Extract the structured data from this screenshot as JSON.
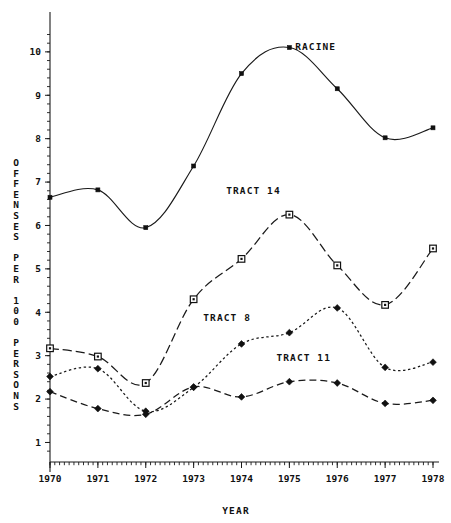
{
  "chart_data": {
    "type": "line",
    "title": "",
    "xlabel": "YEAR",
    "ylabel": "OFFENSES PER 100 PERSONS",
    "x": [
      1970,
      1971,
      1972,
      1973,
      1974,
      1975,
      1976,
      1977,
      1978
    ],
    "xticklabels": [
      "1970",
      "1971",
      "1972",
      "1973",
      "1974",
      "1975",
      "1976",
      "1977",
      "1978"
    ],
    "yticklabels": [
      "1",
      "2",
      "3",
      "4",
      "5",
      "6",
      "7",
      "8",
      "9",
      "10"
    ],
    "yticks": [
      1,
      2,
      3,
      4,
      5,
      6,
      7,
      8,
      9,
      10
    ],
    "xlim": [
      1970,
      1978
    ],
    "ylim": [
      0.55,
      10.55
    ],
    "grid": false,
    "legend_position": "inline-annotations",
    "minor_ticks": true,
    "series": [
      {
        "name": "RACINE",
        "marker": "filled-square",
        "linestyle": "solid",
        "label_x": 1975.55,
        "label_y": 10.05,
        "values": [
          6.65,
          6.82,
          5.95,
          7.37,
          9.5,
          10.1,
          9.15,
          8.02,
          8.25
        ]
      },
      {
        "name": "TRACT 14",
        "marker": "open-square",
        "linestyle": "dash-dot",
        "label_x": 1974.25,
        "label_y": 6.72,
        "values": [
          3.17,
          2.98,
          2.37,
          4.3,
          5.23,
          6.25,
          5.08,
          4.17,
          5.47
        ]
      },
      {
        "name": "TRACT 8",
        "marker": "filled-diamond",
        "linestyle": "dotted",
        "label_x": 1973.7,
        "label_y": 3.8,
        "values": [
          2.52,
          2.7,
          1.72,
          2.27,
          3.27,
          3.53,
          4.1,
          2.73,
          2.85
        ]
      },
      {
        "name": "TRACT 11",
        "marker": "filled-diamond",
        "linestyle": "dashed",
        "label_x": 1975.3,
        "label_y": 2.88,
        "values": [
          2.17,
          1.78,
          1.65,
          2.28,
          2.05,
          2.4,
          2.37,
          1.9,
          1.97
        ]
      }
    ]
  },
  "axis": {
    "y_title_chars": [
      "O",
      "F",
      "F",
      "E",
      "N",
      "S",
      "E",
      "S",
      "",
      "P",
      "E",
      "R",
      "",
      "1",
      "0",
      "0",
      "",
      "P",
      "E",
      "R",
      "S",
      "O",
      "N",
      "S"
    ],
    "x_title": "YEAR"
  }
}
